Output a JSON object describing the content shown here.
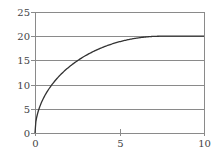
{
  "chart_data": {
    "type": "line",
    "title": "",
    "xlabel": "",
    "ylabel": "",
    "xlim": [
      0,
      10
    ],
    "ylim": [
      0,
      25
    ],
    "x_ticks": [
      0,
      5,
      10
    ],
    "y_ticks": [
      0,
      5,
      10,
      15,
      20,
      25
    ],
    "grid": {
      "horizontal": true,
      "vertical": false
    },
    "legend": null,
    "series": [
      {
        "name": "curve",
        "x": [
          0,
          0.1,
          0.25,
          0.5,
          0.93,
          1.5,
          2.0,
          2.4,
          3.0,
          3.55,
          4.0,
          5.0,
          6.0,
          6.5,
          7.0,
          7.5,
          8.0,
          9.0,
          10.0
        ],
        "y": [
          0,
          3.3,
          5.1,
          7.1,
          9.7,
          11.8,
          13.4,
          14.7,
          16.0,
          17.0,
          17.6,
          18.9,
          19.6,
          19.8,
          19.95,
          20,
          20,
          20,
          20
        ]
      }
    ]
  },
  "colors": {
    "axis": "#8a8a8a",
    "grid": "#8a8a8a",
    "curve": "#333333",
    "text": "#444444"
  }
}
